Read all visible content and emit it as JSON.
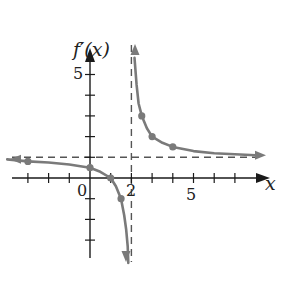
{
  "chart_data": {
    "type": "line",
    "title": "",
    "ylabel": "f'(x)",
    "xlabel": "x",
    "xlim": [
      -4,
      8
    ],
    "ylim": [
      -4,
      6
    ],
    "tick_labels": {
      "x": [
        "0",
        "2",
        "5"
      ],
      "y": [
        "5"
      ]
    },
    "x_ticks": [
      -3,
      -2,
      -1,
      1,
      2,
      3,
      4,
      5,
      6,
      7
    ],
    "y_ticks": [
      -3,
      -2,
      -1,
      1,
      2,
      3,
      4,
      5
    ],
    "asymptotes": {
      "vertical": 2,
      "horizontal": 1
    },
    "series": [
      {
        "name": "left branch",
        "points": [
          [
            -4,
            0.9
          ],
          [
            -3,
            0.8
          ],
          [
            -2,
            0.75
          ],
          [
            -1,
            0.65
          ],
          [
            0,
            0.5
          ],
          [
            0.5,
            0.3
          ],
          [
            1,
            0
          ],
          [
            1.25,
            -0.4
          ],
          [
            1.5,
            -1
          ],
          [
            1.65,
            -1.8
          ],
          [
            1.75,
            -2.5
          ],
          [
            1.82,
            -3.3
          ],
          [
            1.85,
            -4.1
          ]
        ],
        "marked_points": [
          [
            -3,
            0.8
          ],
          [
            0,
            0.5
          ],
          [
            1,
            0
          ],
          [
            1.5,
            -1
          ]
        ]
      },
      {
        "name": "right branch",
        "points": [
          [
            2.15,
            5.8
          ],
          [
            2.25,
            4.5
          ],
          [
            2.35,
            3.6
          ],
          [
            2.5,
            3
          ],
          [
            2.75,
            2.4
          ],
          [
            3,
            2
          ],
          [
            3.5,
            1.7
          ],
          [
            4,
            1.5
          ],
          [
            5,
            1.3
          ],
          [
            6,
            1.2
          ],
          [
            7,
            1.15
          ],
          [
            8,
            1.1
          ]
        ],
        "marked_points": [
          [
            2.5,
            3
          ],
          [
            3,
            2
          ],
          [
            4,
            1.5
          ]
        ]
      }
    ],
    "grid": false,
    "legend": "none"
  },
  "labels": {
    "y_axis": "f′(x)",
    "x_axis": "x",
    "origin": "0",
    "x_two": "2",
    "x_five": "5",
    "y_five": "5"
  },
  "colors": {
    "curve": "#7a7a7a",
    "axis": "#1a1a1a",
    "asymptote": "#555555"
  }
}
